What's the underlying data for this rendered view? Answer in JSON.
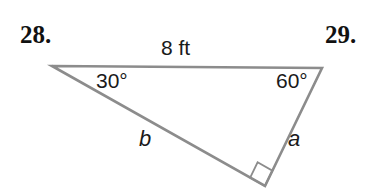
{
  "figure": {
    "problem_numbers": {
      "left": "28.",
      "right": "29."
    },
    "stroke_color": "#8c8c8c",
    "text_color": "#1a1a1a",
    "background": "#ffffff",
    "labels": {
      "top_side": "8 ft",
      "left_angle": "30°",
      "right_angle": "60°",
      "left_side_var": "b",
      "right_side_var": "a"
    },
    "right_angle_marker": "right-angle-square"
  },
  "chart_data": {
    "type": "diagram",
    "shape": "right triangle",
    "title": "",
    "vertices": [
      {
        "name": "A",
        "x": 52,
        "y": 66,
        "angle": 30,
        "angle_label": "30°"
      },
      {
        "name": "B",
        "x": 322,
        "y": 68,
        "angle": 60,
        "angle_label": "60°"
      },
      {
        "name": "C",
        "x": 265,
        "y": 186,
        "angle": 90,
        "angle_label": "right angle"
      }
    ],
    "sides": [
      {
        "from": "A",
        "to": "B",
        "label": "8 ft",
        "value": 8,
        "unit": "ft",
        "role": "hypotenuse"
      },
      {
        "from": "B",
        "to": "C",
        "label": "a",
        "value": null,
        "unit": "ft",
        "role": "leg"
      },
      {
        "from": "A",
        "to": "C",
        "label": "b",
        "value": null,
        "unit": "ft",
        "role": "leg"
      }
    ],
    "grid": false,
    "legend": false
  }
}
